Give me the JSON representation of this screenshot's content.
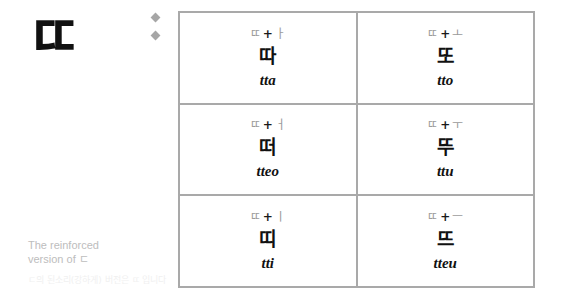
{
  "logo": {
    "glyph": "ㄸ"
  },
  "caption": {
    "english_line1": "The reinforced",
    "english_line2": "version of ㄷ",
    "korean": "ㄷ의 된소리(강하게) 버전은 ㄸ 입니다"
  },
  "bullets": {
    "count": 2,
    "color": "#a6a6a6"
  },
  "table": {
    "border_color": "#a9a9a9",
    "formula_color": "#9a9a9a",
    "text_color": "#111111",
    "rows": [
      [
        {
          "consonant": "ㄸ",
          "operator": "+",
          "vowel": "ㅏ",
          "syllable": "따",
          "romanization": "tta"
        },
        {
          "consonant": "ㄸ",
          "operator": "+",
          "vowel": "ㅗ",
          "syllable": "또",
          "romanization": "tto"
        }
      ],
      [
        {
          "consonant": "ㄸ",
          "operator": "+",
          "vowel": "ㅓ",
          "syllable": "떠",
          "romanization": "tteo"
        },
        {
          "consonant": "ㄸ",
          "operator": "+",
          "vowel": "ㅜ",
          "syllable": "뚜",
          "romanization": "ttu"
        }
      ],
      [
        {
          "consonant": "ㄸ",
          "operator": "+",
          "vowel": "ㅣ",
          "syllable": "띠",
          "romanization": "tti"
        },
        {
          "consonant": "ㄸ",
          "operator": "+",
          "vowel": "ㅡ",
          "syllable": "뜨",
          "romanization": "tteu"
        }
      ]
    ]
  }
}
